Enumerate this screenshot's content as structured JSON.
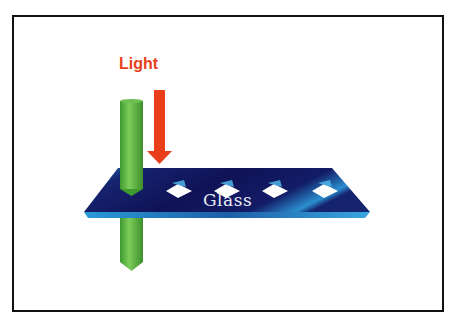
{
  "diagram": {
    "labels": {
      "light": "Light",
      "glass": "Glass"
    },
    "elements": [
      "green-light-beam",
      "red-light-arrow",
      "glass-plate",
      "diamond-holes"
    ],
    "hole_count": 4,
    "colors": {
      "light_label": "#e8401c",
      "arrow": "#e8401c",
      "beam": "#4caf3a",
      "glass_dark": "#14155c",
      "glass_highlight": "#2a8fd0",
      "frame": "#111111"
    }
  }
}
